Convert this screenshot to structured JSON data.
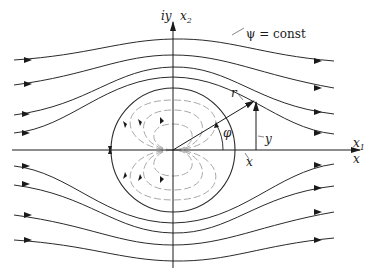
{
  "diagram": {
    "type": "flow-around-cylinder",
    "labels": {
      "imag_axis": "iy",
      "x2_axis": "x",
      "x2_sub": "2",
      "x1_axis": "x",
      "x1_sub": "1",
      "real_axis": "x",
      "psi_label": "ψ = const",
      "r_label": "r",
      "phi_label": "φ",
      "y_label": "y",
      "x_label": "x"
    },
    "colors": {
      "streamline": "#2a2a2a",
      "dipole": "#a8a8a8",
      "axis": "#1a1a1a",
      "background": "#ffffff"
    },
    "geometry": {
      "origin": [
        173,
        150
      ],
      "circle_radius": 62,
      "streamline_count_above": 4,
      "streamline_count_below": 4,
      "dipole_loops_per_side": 3
    }
  }
}
